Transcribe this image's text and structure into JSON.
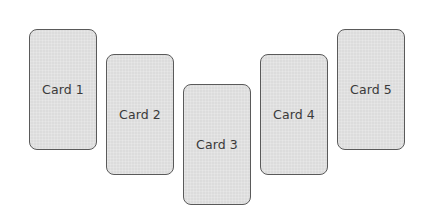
{
  "cards": [
    {
      "label": "Card 1"
    },
    {
      "label": "Card 2"
    },
    {
      "label": "Card 3"
    },
    {
      "label": "Card 4"
    },
    {
      "label": "Card 5"
    }
  ],
  "colors": {
    "card_fill": "#dcdcdc",
    "card_border": "#5a5a5a",
    "text": "#3a3a3a",
    "background": "#ffffff"
  }
}
